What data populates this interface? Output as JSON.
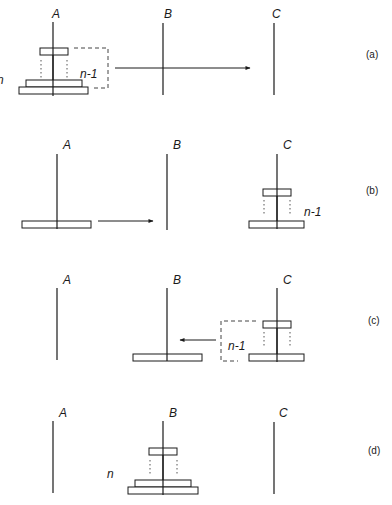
{
  "figure": {
    "peg_labels": [
      "A",
      "B",
      "C"
    ],
    "panels": [
      {
        "id": "a",
        "label": "(a)",
        "description": "n disks on peg A; top n-1 disks moved from A to C",
        "disk_count_label": "n",
        "group_label": "n-1",
        "arrow": "A to C"
      },
      {
        "id": "b",
        "label": "(b)",
        "description": "largest disk on A moves to B; n-1 disks on C",
        "group_label": "n-1",
        "arrow": "A to B"
      },
      {
        "id": "c",
        "label": "(c)",
        "description": "largest disk on B; n-1 disks move from C to B",
        "group_label": "n-1",
        "arrow": "C to B"
      },
      {
        "id": "d",
        "label": "(d)",
        "description": "all n disks on peg B",
        "disk_count_label": "n"
      }
    ]
  }
}
